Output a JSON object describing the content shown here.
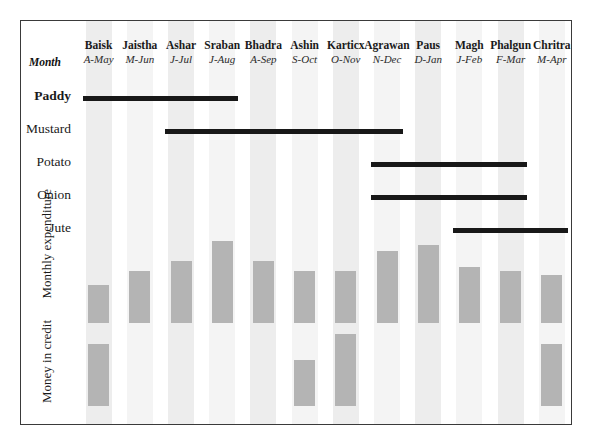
{
  "chart_data": {
    "type": "table",
    "title": "",
    "xlabel": "",
    "ylabel": "",
    "row_header_label": "Month",
    "categories": [
      "Baisk",
      "Jaistha",
      "Ashar",
      "Sraban",
      "Bhadra",
      "Ashin",
      "Karticx",
      "Agrawan",
      "Paus",
      "Magh",
      "Phalgun",
      "Chritra"
    ],
    "category_subtitles": [
      "A-May",
      "M-Jun",
      "J-Jul",
      "J-Aug",
      "A-Sep",
      "S-Oct",
      "O-Nov",
      "N-Dec",
      "D-Jan",
      "J-Feb",
      "F-Mar",
      "M-Apr"
    ],
    "crop_rows": [
      {
        "label": "Paddy",
        "bold": true,
        "start_index": 0,
        "end_index": 3
      },
      {
        "label": "Mustard",
        "bold": false,
        "start_index": 2,
        "end_index": 7
      },
      {
        "label": "Potato",
        "bold": false,
        "start_index": 7,
        "end_index": 10
      },
      {
        "label": "Onion",
        "bold": false,
        "start_index": 7,
        "end_index": 10
      },
      {
        "label": "Jute",
        "bold": false,
        "start_index": 9,
        "end_index": 11
      }
    ],
    "series": [
      {
        "name": "Monthly expenditure",
        "values": [
          38,
          52,
          62,
          82,
          62,
          52,
          52,
          72,
          78,
          56,
          52,
          48
        ]
      },
      {
        "name": "Money in credit",
        "values": [
          62,
          0,
          0,
          0,
          0,
          46,
          72,
          0,
          0,
          0,
          0,
          62
        ]
      }
    ],
    "legend_position": "none",
    "grid": false,
    "band_color": "#ededed",
    "bar_color": "#b4b4b4",
    "crop_bar_color": "#181818",
    "frame_color": "#3a3a3a"
  }
}
